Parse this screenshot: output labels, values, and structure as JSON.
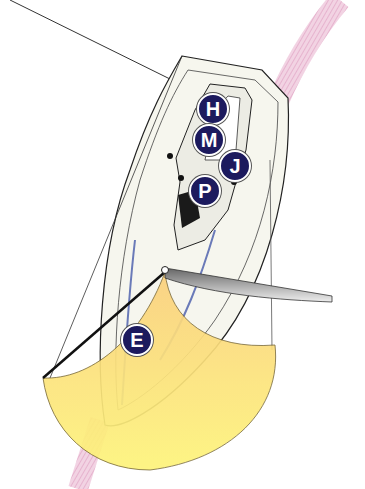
{
  "diagram": {
    "labels": [
      {
        "id": "H",
        "text": "H",
        "x": 197,
        "y": 93
      },
      {
        "id": "M",
        "text": "M",
        "x": 193,
        "y": 124
      },
      {
        "id": "J",
        "text": "J",
        "x": 219,
        "y": 150
      },
      {
        "id": "P",
        "text": "P",
        "x": 189,
        "y": 175
      },
      {
        "id": "E",
        "text": "E",
        "x": 121,
        "y": 324
      }
    ],
    "colors": {
      "marker_fill": "#1c1a5e",
      "sail_fill_top": "#fbd88a",
      "sail_fill_bottom": "#fdf27a",
      "track_band": "#e8b4cf",
      "hull_fill": "#f6f6ee",
      "outline": "#222222"
    }
  }
}
